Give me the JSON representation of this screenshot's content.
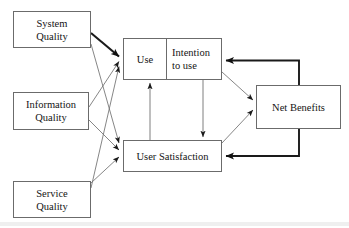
{
  "diagram": {
    "type": "flow-diagram",
    "nodes": {
      "system_quality": "System\nQuality",
      "information_quality": "Information\nQuality",
      "service_quality": "Service\nQuality",
      "use": "Use",
      "intention_to_use": "Intention\nto use",
      "user_satisfaction": "User Satisfaction",
      "net_benefits": "Net Benefits"
    },
    "edges": [
      {
        "from": "system_quality",
        "to": "use",
        "style": "thick"
      },
      {
        "from": "system_quality",
        "to": "user_satisfaction",
        "style": "thin"
      },
      {
        "from": "information_quality",
        "to": "use",
        "style": "thin"
      },
      {
        "from": "information_quality",
        "to": "user_satisfaction",
        "style": "thin"
      },
      {
        "from": "service_quality",
        "to": "use",
        "style": "thin"
      },
      {
        "from": "service_quality",
        "to": "user_satisfaction",
        "style": "thin"
      },
      {
        "from": "user_satisfaction",
        "to": "use",
        "style": "thin"
      },
      {
        "from": "intention_to_use",
        "to": "user_satisfaction",
        "style": "thin"
      },
      {
        "from": "use",
        "to": "net_benefits",
        "style": "thin"
      },
      {
        "from": "user_satisfaction",
        "to": "net_benefits",
        "style": "thin"
      },
      {
        "from": "net_benefits",
        "to": "intention_to_use",
        "style": "thick"
      },
      {
        "from": "net_benefits",
        "to": "user_satisfaction",
        "style": "thick"
      }
    ],
    "colors": {
      "box_border": "#6b6b6b",
      "arrow_thin": "#707070",
      "arrow_thick": "#1a1a1a",
      "text": "#141414",
      "background": "#ffffff"
    }
  }
}
